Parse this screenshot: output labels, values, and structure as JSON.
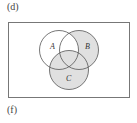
{
  "labels": {
    "top": "(d)",
    "bottom": "(f)"
  },
  "venn": {
    "sets": [
      {
        "name": "A",
        "cx": 59,
        "cy": 50,
        "r": 19.5
      },
      {
        "name": "B",
        "cx": 79,
        "cy": 50,
        "r": 19.5
      },
      {
        "name": "C",
        "cx": 69,
        "cy": 70,
        "r": 19.5
      }
    ],
    "shaded_region": "C ∪ (B − A)",
    "colors": {
      "shade": "#e0e0e0",
      "stroke": "#555555",
      "frame": "#777777",
      "background": "#ffffff"
    }
  }
}
